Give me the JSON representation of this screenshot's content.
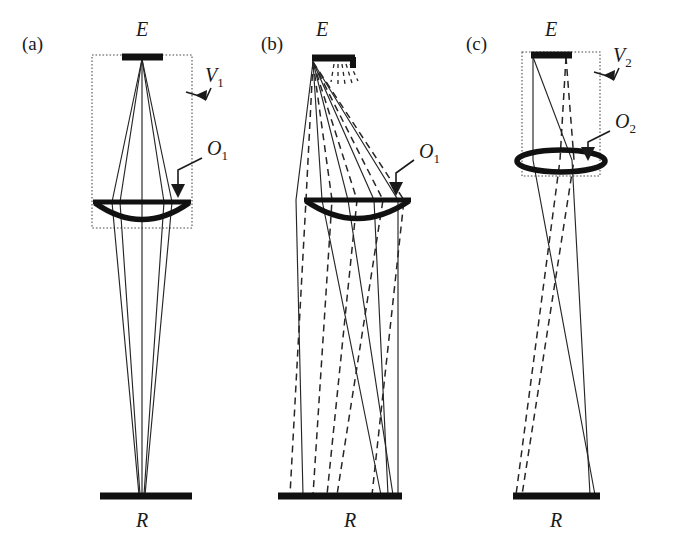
{
  "figure": {
    "background_color": "#ffffff",
    "ink_color": "#1a1a1a",
    "dashed_box_color": "#4d4d4d",
    "width": 673,
    "height": 537
  },
  "panels": [
    {
      "id": "a",
      "label": "(a)",
      "label_x": 22,
      "label_y": 50,
      "emitter": {
        "symbol": "E",
        "label_x": 140,
        "label_y": 34
      },
      "receiver": {
        "symbol": "R",
        "label_x": 140,
        "label_y": 527
      },
      "volume": {
        "symbol": "V",
        "subscript": "1",
        "label_x": 205,
        "label_y": 80
      },
      "optic": {
        "symbol": "O",
        "subscript": "1",
        "label_x": 207,
        "label_y": 152,
        "type": "plano-convex-lens"
      },
      "ray_style": "solid-only",
      "ray_count_solid": 3,
      "ray_count_dashed": 0,
      "focus": "converges to a point on R"
    },
    {
      "id": "b",
      "label": "(b)",
      "label_x": 261,
      "label_y": 50,
      "emitter": {
        "symbol": "E",
        "label_x": 322,
        "label_y": 34
      },
      "receiver": {
        "symbol": "R",
        "label_x": 350,
        "label_y": 527
      },
      "volume": null,
      "optic": {
        "symbol": "O",
        "subscript": "1",
        "label_x": 419,
        "label_y": 155,
        "type": "plano-convex-lens"
      },
      "ray_style": "solid-and-dashed",
      "ray_count_solid": 5,
      "ray_count_dashed": 5,
      "focus": "fan of rays crossing before R"
    },
    {
      "id": "c",
      "label": "(c)",
      "label_x": 466,
      "label_y": 50,
      "emitter": {
        "symbol": "E",
        "label_x": 556,
        "label_y": 34
      },
      "receiver": {
        "symbol": "R",
        "label_x": 556,
        "label_y": 527
      },
      "volume": {
        "symbol": "V",
        "subscript": "2",
        "label_x": 613,
        "label_y": 60
      },
      "optic": {
        "symbol": "O",
        "subscript": "2",
        "label_x": 615,
        "label_y": 125,
        "type": "biconvex-lens"
      },
      "ray_style": "solid-and-dashed",
      "ray_count_solid": 2,
      "ray_count_dashed": 2,
      "focus": "two diverging bundles reaching R"
    }
  ],
  "legend_symbols": {
    "E": "emitter / source bar",
    "R": "receiver / detector bar",
    "V": "sensitive volume (dashed box)",
    "O": "optical element (lens)"
  }
}
